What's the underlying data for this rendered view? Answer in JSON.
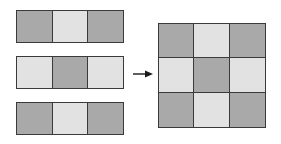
{
  "colors": {
    "dark": "#a9a9a9",
    "light": "#e2e2e2",
    "border": "#3a3a3a",
    "arrow": "#1a1a1a"
  },
  "strips": [
    {
      "top": 10,
      "cells": [
        "dark",
        "light",
        "dark"
      ]
    },
    {
      "top": 56,
      "cells": [
        "light",
        "dark",
        "light"
      ]
    },
    {
      "top": 102,
      "cells": [
        "dark",
        "light",
        "dark"
      ]
    }
  ],
  "grid": {
    "rows": [
      [
        "dark",
        "light",
        "dark"
      ],
      [
        "light",
        "dark",
        "light"
      ],
      [
        "dark",
        "light",
        "dark"
      ]
    ]
  },
  "arrow": {
    "direction": "right"
  }
}
